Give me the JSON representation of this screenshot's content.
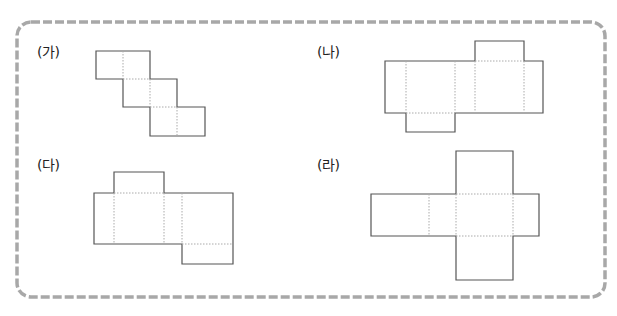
{
  "figures": [
    {
      "id": "ga",
      "label": "(가)",
      "description": "net of six squares in staircase: rows of 2 squares shifted right"
    },
    {
      "id": "na",
      "label": "(나)",
      "description": "net of rectangular prism with 4 side faces in a row and tabs top-right and bottom-left"
    },
    {
      "id": "da",
      "label": "(다)",
      "description": "net with 3 side faces in a row, tab on top-left face and bottom-right face"
    },
    {
      "id": "ra",
      "label": "(라)",
      "description": "cross-shaped net of rectangular prism"
    }
  ],
  "colors": {
    "border": "#9a9a9a",
    "line": "#555555",
    "fold": "#aaaaaa"
  }
}
